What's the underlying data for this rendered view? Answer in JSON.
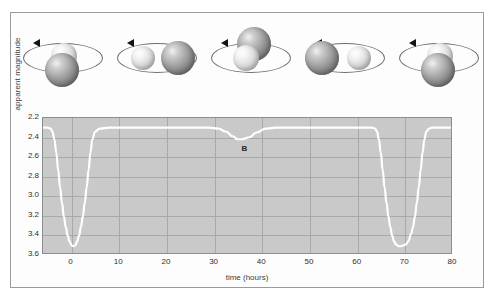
{
  "orbit_diagrams": {
    "panels": [
      {
        "name": "panel-1-primary-eclipse",
        "phase_hours": 0,
        "description": "dim star in front of bright star",
        "arrow_direction": "counterclockwise"
      },
      {
        "name": "panel-2-quadrature-left",
        "phase_hours": 17,
        "description": "bright star left, dim star right, side by side",
        "arrow_direction": "counterclockwise"
      },
      {
        "name": "panel-3-secondary-eclipse",
        "phase_hours": 35,
        "description": "dim star behind, bright star transits in front",
        "arrow_direction": "counterclockwise"
      },
      {
        "name": "panel-4-quadrature-right",
        "phase_hours": 52,
        "description": "dim star left, bright star right, side by side",
        "arrow_direction": "counterclockwise"
      },
      {
        "name": "panel-5-primary-eclipse-repeat",
        "phase_hours": 70,
        "description": "dim star in front of bright star again",
        "arrow_direction": "counterclockwise"
      }
    ]
  },
  "chart_data": {
    "type": "line",
    "title": "",
    "xlabel": "time (hours)",
    "ylabel": "apparent magnitude",
    "xlim": [
      -6,
      80
    ],
    "ylim": [
      2.2,
      3.6
    ],
    "y_inverted": true,
    "grid": true,
    "legend": "none",
    "xticks": [
      0,
      10,
      20,
      30,
      40,
      50,
      60,
      70,
      80
    ],
    "yticks": [
      "2.2",
      "2.4",
      "2.6",
      "2.8",
      "3.0",
      "3.2",
      "3.4",
      "3.6"
    ],
    "annotations": [
      {
        "label": "A",
        "x": 0,
        "y": 3.52,
        "meaning": "primary minimum"
      },
      {
        "label": "B",
        "x": 35,
        "y": 2.42,
        "meaning": "secondary minimum"
      },
      {
        "label": "A",
        "x": 70,
        "y": 3.52,
        "meaning": "primary minimum repeat"
      }
    ],
    "series": [
      {
        "name": "apparent magnitude",
        "color": "#ffffff",
        "x": [
          -6,
          -5,
          -4.4,
          -4,
          -3.6,
          -3.2,
          -2.8,
          -2.4,
          -2,
          -1.6,
          -1.2,
          -0.8,
          -0.4,
          0,
          0.4,
          0.8,
          1.2,
          1.6,
          2,
          2.4,
          2.8,
          3.2,
          3.6,
          4,
          4.4,
          5,
          6,
          8,
          10,
          14,
          18,
          22,
          26,
          29,
          31,
          32.5,
          34,
          35,
          36,
          37.5,
          39,
          41,
          43,
          47,
          52,
          57,
          61,
          63.4,
          64,
          64.4,
          64.8,
          65.2,
          65.6,
          66,
          66.4,
          66.8,
          67.2,
          67.6,
          68,
          68.4,
          69,
          69.5,
          70,
          70.5,
          71,
          71.6,
          72,
          72.4,
          72.8,
          73.2,
          73.6,
          74,
          74.4,
          74.8,
          75.4,
          76,
          78,
          80
        ],
        "y": [
          2.3,
          2.3,
          2.31,
          2.34,
          2.42,
          2.56,
          2.74,
          2.92,
          3.08,
          3.22,
          3.33,
          3.42,
          3.48,
          3.52,
          3.53,
          3.52,
          3.48,
          3.42,
          3.33,
          3.22,
          3.08,
          2.92,
          2.74,
          2.56,
          2.42,
          2.34,
          2.31,
          2.3,
          2.3,
          2.3,
          2.3,
          2.3,
          2.3,
          2.3,
          2.31,
          2.34,
          2.39,
          2.42,
          2.42,
          2.4,
          2.35,
          2.31,
          2.3,
          2.3,
          2.3,
          2.3,
          2.3,
          2.3,
          2.31,
          2.34,
          2.42,
          2.56,
          2.74,
          2.92,
          3.08,
          3.22,
          3.33,
          3.42,
          3.48,
          3.51,
          3.53,
          3.53,
          3.52,
          3.51,
          3.48,
          3.4,
          3.33,
          3.22,
          3.08,
          2.92,
          2.74,
          2.56,
          2.42,
          2.34,
          2.31,
          2.3,
          2.3,
          2.3
        ]
      }
    ]
  },
  "colors": {
    "plot_background": "#c9c9c9",
    "gridline": "#a9a9a9",
    "curve": "#ffffff",
    "frame_border": "#9a9a9a",
    "text": "#2f2f2f"
  }
}
